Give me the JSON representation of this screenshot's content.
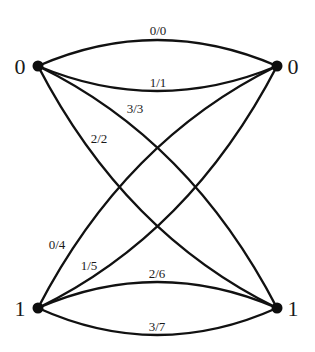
{
  "diagram": {
    "type": "bipartite-multigraph",
    "nodes": [
      {
        "id": "top-left",
        "label": "0",
        "x": 38,
        "y": 66
      },
      {
        "id": "top-right",
        "label": "0",
        "x": 277,
        "y": 66
      },
      {
        "id": "bottom-left",
        "label": "1",
        "x": 38,
        "y": 308
      },
      {
        "id": "bottom-right",
        "label": "1",
        "x": 277,
        "y": 308
      }
    ],
    "edges": [
      {
        "label": "0/0",
        "from": "top-left",
        "to": "top-right"
      },
      {
        "label": "1/1",
        "from": "top-left",
        "to": "top-right"
      },
      {
        "label": "3/3",
        "from": "top-left",
        "to": "bottom-right"
      },
      {
        "label": "2/2",
        "from": "top-left",
        "to": "bottom-right"
      },
      {
        "label": "0/4",
        "from": "bottom-left",
        "to": "top-right"
      },
      {
        "label": "1/5",
        "from": "bottom-left",
        "to": "top-right"
      },
      {
        "label": "2/6",
        "from": "bottom-left",
        "to": "bottom-right"
      },
      {
        "label": "3/7",
        "from": "bottom-left",
        "to": "bottom-right"
      }
    ],
    "colors": {
      "stroke": "#111111",
      "background": "#ffffff"
    }
  }
}
